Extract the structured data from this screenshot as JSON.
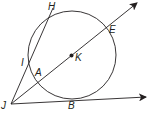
{
  "diagram": {
    "circle": {
      "center_label": "K",
      "cx": 72,
      "cy": 56,
      "r": 44
    },
    "points": [
      {
        "label": "H",
        "x": 48,
        "y": 2
      },
      {
        "label": "E",
        "x": 109,
        "y": 25
      },
      {
        "label": "K",
        "x": 75,
        "y": 53
      },
      {
        "label": "I",
        "x": 20,
        "y": 58
      },
      {
        "label": "A",
        "x": 35,
        "y": 68
      },
      {
        "label": "J",
        "x": 1,
        "y": 101
      },
      {
        "label": "B",
        "x": 68,
        "y": 101
      }
    ],
    "segments": [
      "JH"
    ],
    "rays": [
      "JE (through A, K)",
      "JB (tangent)"
    ],
    "colors": {
      "stroke": "#231f20",
      "background": "#ffffff"
    }
  }
}
